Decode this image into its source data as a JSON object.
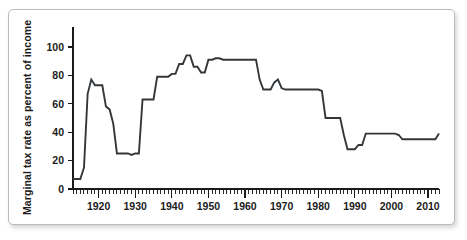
{
  "figure": {
    "background_color": "#ffffff",
    "frame_color": "#b9bbbd",
    "line_color": "#33373a",
    "text_color": "#1b1b1b"
  },
  "axis": {
    "y_title": "Marginal tax rate as percent of income",
    "y_ticks": [
      "0",
      "20",
      "40",
      "60",
      "80",
      "100"
    ],
    "x_ticks": [
      "1920",
      "1930",
      "1940",
      "1950",
      "1960",
      "1970",
      "1980",
      "1990",
      "2000",
      "2010"
    ]
  },
  "chart_data": {
    "type": "line",
    "title": "",
    "subtitle": "",
    "xlabel": "",
    "ylabel": "Marginal tax rate as percent of income",
    "xlim": [
      1913,
      2013
    ],
    "ylim": [
      0,
      114
    ],
    "ytick_values": [
      0,
      20,
      40,
      60,
      80,
      100
    ],
    "xtick_values": [
      1920,
      1930,
      1940,
      1950,
      1960,
      1970,
      1980,
      1990,
      2000,
      2010
    ],
    "grid": false,
    "legend": null,
    "series": [
      {
        "name": "Top marginal tax rate",
        "x": [
          1913,
          1914,
          1915,
          1916,
          1917,
          1918,
          1919,
          1920,
          1921,
          1922,
          1923,
          1924,
          1925,
          1926,
          1927,
          1928,
          1929,
          1930,
          1931,
          1932,
          1933,
          1934,
          1935,
          1936,
          1937,
          1938,
          1939,
          1940,
          1941,
          1942,
          1943,
          1944,
          1945,
          1946,
          1947,
          1948,
          1949,
          1950,
          1951,
          1952,
          1953,
          1954,
          1955,
          1956,
          1957,
          1958,
          1959,
          1960,
          1961,
          1962,
          1963,
          1964,
          1965,
          1966,
          1967,
          1968,
          1969,
          1970,
          1971,
          1972,
          1973,
          1974,
          1975,
          1976,
          1977,
          1978,
          1979,
          1980,
          1981,
          1982,
          1983,
          1984,
          1985,
          1986,
          1987,
          1988,
          1989,
          1990,
          1991,
          1992,
          1993,
          1994,
          1995,
          1996,
          1997,
          1998,
          1999,
          2000,
          2001,
          2002,
          2003,
          2004,
          2005,
          2006,
          2007,
          2008,
          2009,
          2010,
          2011,
          2012,
          2013
        ],
        "y": [
          7,
          7,
          7,
          15,
          67,
          77,
          73,
          73,
          73,
          58,
          56,
          46,
          25,
          25,
          25,
          25,
          24,
          25,
          25,
          63,
          63,
          63,
          63,
          79,
          79,
          79,
          79,
          81,
          81,
          88,
          88,
          94,
          94,
          86,
          86,
          82,
          82,
          91,
          91,
          92,
          92,
          91,
          91,
          91,
          91,
          91,
          91,
          91,
          91,
          91,
          91,
          77,
          70,
          70,
          70,
          75,
          77,
          71,
          70,
          70,
          70,
          70,
          70,
          70,
          70,
          70,
          70,
          70,
          69,
          50,
          50,
          50,
          50,
          50,
          38,
          28,
          28,
          28,
          31,
          31,
          39,
          39,
          39,
          39,
          39,
          39,
          39,
          39,
          39,
          38,
          35,
          35,
          35,
          35,
          35,
          35,
          35,
          35,
          35,
          35,
          39
        ]
      }
    ]
  }
}
